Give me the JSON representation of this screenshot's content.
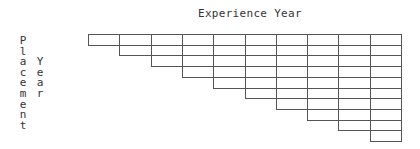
{
  "title": "Experience Year",
  "y_label_1": "Placement",
  "y_label_2": "Year",
  "grid": {
    "columns": 10,
    "rows": 10,
    "shape": "upper-triangular (row i starts at column i)",
    "cell_width": 31.3,
    "cell_height": 10.7,
    "line_color": "#555555"
  }
}
